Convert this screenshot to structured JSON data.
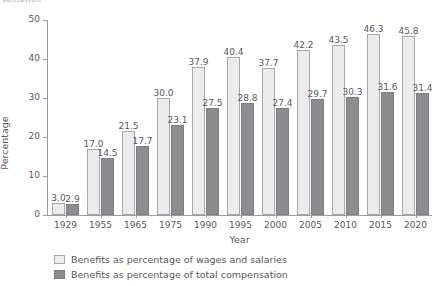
{
  "top_fragment": "sentation",
  "chart_data": {
    "type": "bar",
    "title": "",
    "subtitle": "",
    "xlabel": "Year",
    "ylabel": "Percentage",
    "ylim": [
      0,
      50
    ],
    "yticks": [
      0,
      10,
      20,
      30,
      40,
      50
    ],
    "grid": false,
    "legend_position": "bottom-left",
    "categories": [
      "1929",
      "1955",
      "1965",
      "1975",
      "1990",
      "1995",
      "2000",
      "2005",
      "2010",
      "2015",
      "2020"
    ],
    "series": [
      {
        "name": "Benefits as percentage of wages and salaries",
        "color": "#ececec",
        "values": [
          3.0,
          17.0,
          21.5,
          30.0,
          37.9,
          40.4,
          37.7,
          42.2,
          43.5,
          46.3,
          45.8
        ],
        "labels": [
          "3.0",
          "17.0",
          "21.5",
          "30.0",
          "37.9",
          "40.4",
          "37.7",
          "42.2",
          "43.5",
          "46.3",
          "45.8"
        ]
      },
      {
        "name": "Benefits as percentage of total compensation",
        "color": "#8d8d8f",
        "values": [
          2.9,
          14.5,
          17.7,
          23.1,
          27.5,
          28.8,
          27.4,
          29.7,
          30.3,
          31.6,
          31.4
        ],
        "labels": [
          "2.9",
          "14.5",
          "17.7",
          "23.1",
          "27.5",
          "28.8",
          "27.4",
          "29.7",
          "30.3",
          "31.6",
          "31.4"
        ]
      }
    ]
  },
  "axis": {
    "y_title": "Percentage",
    "x_title": "Year",
    "y_tick_labels": [
      "0",
      "10",
      "20",
      "30",
      "40",
      "50"
    ]
  },
  "legend": {
    "items": [
      {
        "label": "Benefits as percentage of wages and salaries",
        "swatch": "light"
      },
      {
        "label": "Benefits as percentage of total compensation",
        "swatch": "dark"
      }
    ]
  },
  "colors": {
    "series_light": "#ececec",
    "series_dark": "#8d8d8f",
    "axis": "#9d9d9f",
    "text": "#58585a",
    "background": "#ffffff"
  }
}
